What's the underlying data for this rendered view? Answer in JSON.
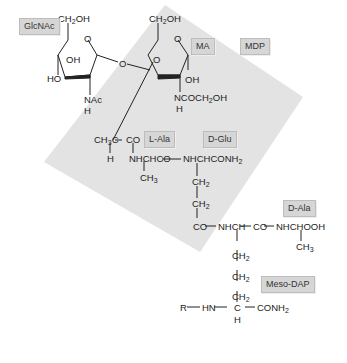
{
  "labels": {
    "glcnac": "GlcNAc",
    "ma": "MA",
    "mdp": "MDP",
    "l_ala": "L-Ala",
    "d_glu": "D-Glu",
    "d_ala": "D-Ala",
    "meso_dap": "Meso-DAP"
  },
  "structure": {
    "glcnac_ring": {
      "ch2oh": "CH2OH",
      "ring_o": "O",
      "oh": "OH",
      "ho": "HO",
      "nac": "NAc",
      "h": "H"
    },
    "glycosidic_o": "O",
    "ma_ring": {
      "ch2oh": "CH2OH",
      "ring_o": "O",
      "inner_o": "O",
      "oh": "OH",
      "ncoch2oh": "NCOCH2OH",
      "h": "H"
    },
    "lactyl": {
      "ch3c": "CH3C",
      "co": "CO",
      "h": "H"
    },
    "l_ala_chain": {
      "nhchco": "NHCHCO",
      "ch3": "CH3"
    },
    "d_glu_chain": {
      "nhchconh2": "NHCHCONH2",
      "ch2_a": "CH2",
      "ch2_b": "CH2",
      "co": "CO"
    },
    "dap_chain": {
      "nhch": "NHCH",
      "co": "CO",
      "nhchooh": "NHCHOOH",
      "ch3": "CH3",
      "ch2_a": "CH2",
      "ch2_b": "CH2",
      "ch2_c": "CH2",
      "r": "R",
      "hn": "HN",
      "c": "C",
      "conh2": "CONH2",
      "h": "H"
    }
  },
  "colors": {
    "shade": "#e3e3e3",
    "label_bg": "#d6d6d6",
    "ink": "#222222"
  }
}
